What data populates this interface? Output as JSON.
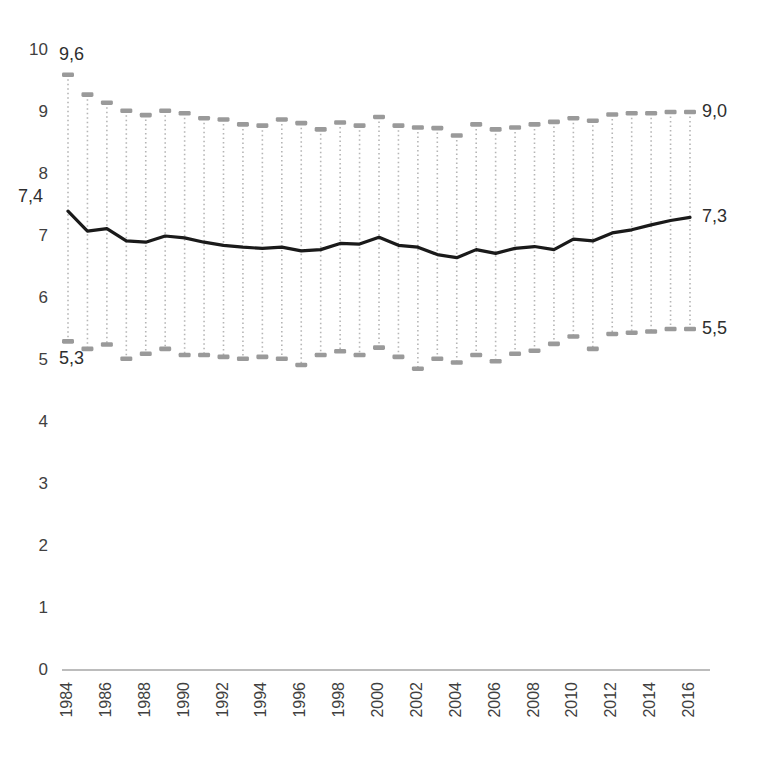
{
  "chart_data": {
    "type": "line",
    "title": "",
    "subtitle": "",
    "xlabel": "",
    "ylabel": "",
    "grid": false,
    "legend": "none",
    "ylim": [
      0,
      10
    ],
    "ytick_labels": [
      "10",
      "9",
      "8",
      "7",
      "6",
      "5",
      "4",
      "3",
      "2",
      "1",
      "0"
    ],
    "ytick_values": [
      10,
      9,
      8,
      7,
      6,
      5,
      4,
      3,
      2,
      1,
      0
    ],
    "categories": [
      "1984",
      "1985",
      "1986",
      "1987",
      "1988",
      "1989",
      "1990",
      "1991",
      "1992",
      "1993",
      "1994",
      "1995",
      "1996",
      "1997",
      "1998",
      "1999",
      "2000",
      "2001",
      "2002",
      "2003",
      "2004",
      "2005",
      "2006",
      "2007",
      "2008",
      "2009",
      "2010",
      "2011",
      "2012",
      "2013",
      "2014",
      "2015",
      "2016"
    ],
    "xtick_labels": [
      "1984",
      "1986",
      "1988",
      "1990",
      "1992",
      "1994",
      "1996",
      "1998",
      "2000",
      "2002",
      "2004",
      "2006",
      "2008",
      "2010",
      "2012",
      "2014",
      "2016"
    ],
    "xtick_label_interval": 2,
    "series": [
      {
        "name": "mean",
        "style": "line",
        "color": "#1a1a1a",
        "values": [
          7.4,
          7.08,
          7.12,
          6.92,
          6.9,
          7.0,
          6.97,
          6.9,
          6.85,
          6.82,
          6.8,
          6.82,
          6.76,
          6.78,
          6.88,
          6.87,
          6.98,
          6.85,
          6.82,
          6.7,
          6.65,
          6.78,
          6.72,
          6.8,
          6.83,
          6.78,
          6.95,
          6.92,
          7.05,
          7.1,
          7.18,
          7.25,
          7.3
        ]
      },
      {
        "name": "upper",
        "style": "marker",
        "color": "#9a9a9a",
        "values": [
          9.6,
          9.28,
          9.15,
          9.02,
          8.95,
          9.02,
          8.98,
          8.9,
          8.88,
          8.8,
          8.78,
          8.88,
          8.82,
          8.72,
          8.83,
          8.78,
          8.92,
          8.78,
          8.75,
          8.74,
          8.62,
          8.8,
          8.72,
          8.75,
          8.8,
          8.84,
          8.9,
          8.86,
          8.96,
          8.98,
          8.98,
          9.0,
          9.0
        ]
      },
      {
        "name": "lower",
        "style": "marker",
        "color": "#9a9a9a",
        "values": [
          5.3,
          5.18,
          5.25,
          5.02,
          5.1,
          5.18,
          5.08,
          5.08,
          5.05,
          5.02,
          5.05,
          5.02,
          4.92,
          5.08,
          5.14,
          5.08,
          5.2,
          5.05,
          4.86,
          5.02,
          4.96,
          5.08,
          4.98,
          5.1,
          5.15,
          5.26,
          5.38,
          5.18,
          5.42,
          5.44,
          5.46,
          5.5,
          5.5
        ]
      }
    ],
    "annotations": [
      {
        "name": "upper-start-label",
        "text": "9,6",
        "series": "upper",
        "position": "start"
      },
      {
        "name": "upper-end-label",
        "text": "9,0",
        "series": "upper",
        "position": "end"
      },
      {
        "name": "mean-start-label",
        "text": "7,4",
        "series": "mean",
        "position": "start"
      },
      {
        "name": "mean-end-label",
        "text": "7,3",
        "series": "mean",
        "position": "end"
      },
      {
        "name": "lower-start-label",
        "text": "5,3",
        "series": "lower",
        "position": "start"
      },
      {
        "name": "lower-end-label",
        "text": "5,5",
        "series": "lower",
        "position": "end"
      }
    ],
    "colors": {
      "line": "#1a1a1a",
      "marker": "#9a9a9a",
      "stem": "#b5b5b5",
      "axis": "#a6a6a6",
      "tick_text": "#404040"
    }
  }
}
